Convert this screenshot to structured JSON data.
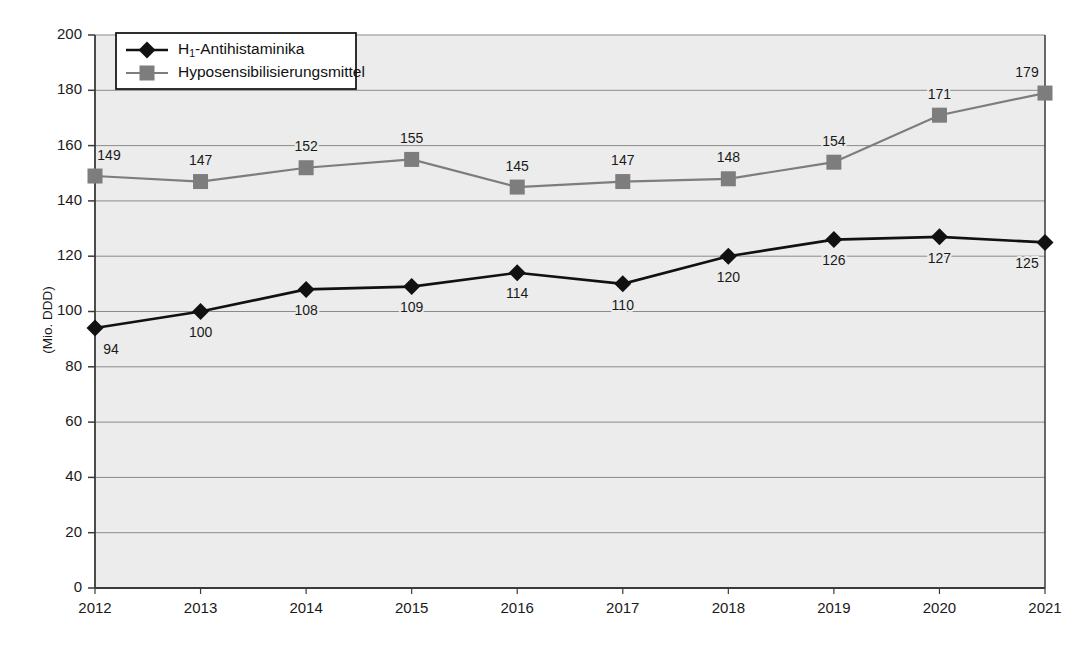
{
  "chart_data": {
    "type": "line",
    "title": "",
    "xlabel": "",
    "ylabel": "(Mio. DDD)",
    "categories": [
      "2012",
      "2013",
      "2014",
      "2015",
      "2016",
      "2017",
      "2018",
      "2019",
      "2020",
      "2021"
    ],
    "x": [
      2012,
      2013,
      2014,
      2015,
      2016,
      2017,
      2018,
      2019,
      2020,
      2021
    ],
    "ylim": [
      0,
      200
    ],
    "yticks": [
      0,
      20,
      40,
      60,
      80,
      100,
      120,
      140,
      160,
      180,
      200
    ],
    "ytick_labels": [
      "0",
      "20",
      "40",
      "60",
      "80",
      "100",
      "120",
      "140",
      "160",
      "180",
      "200"
    ],
    "grid": true,
    "legend_position": "top-left",
    "series": [
      {
        "name": "H1-Antihistaminika",
        "legend_label_main": "H",
        "legend_label_sub": "1",
        "legend_label_rest": "-Antihistaminika",
        "marker": "diamond",
        "color": "#111111",
        "values": [
          94,
          100,
          108,
          109,
          114,
          110,
          120,
          126,
          127,
          125
        ],
        "labels": [
          "94",
          "100",
          "108",
          "109",
          "114",
          "110",
          "120",
          "126",
          "127",
          "125"
        ],
        "label_position": "below"
      },
      {
        "name": "Hyposensibilisierungsmittel",
        "legend_label_main": "Hyposensibilisierungsmittel",
        "legend_label_sub": "",
        "legend_label_rest": "",
        "marker": "square",
        "color": "#7d7d7d",
        "values": [
          149,
          147,
          152,
          155,
          145,
          147,
          148,
          154,
          171,
          179
        ],
        "labels": [
          "149",
          "147",
          "152",
          "155",
          "145",
          "147",
          "148",
          "154",
          "171",
          "179"
        ],
        "label_position": "above"
      }
    ],
    "colors": {
      "plot_background": "#ececec",
      "gridline": "#8a8a8a",
      "axis": "#3a3a3a",
      "series_1": "#111111",
      "series_2": "#7d7d7d",
      "legend_background": "#ffffff",
      "legend_border": "#1a1a1a",
      "page_background": "#ffffff"
    }
  }
}
